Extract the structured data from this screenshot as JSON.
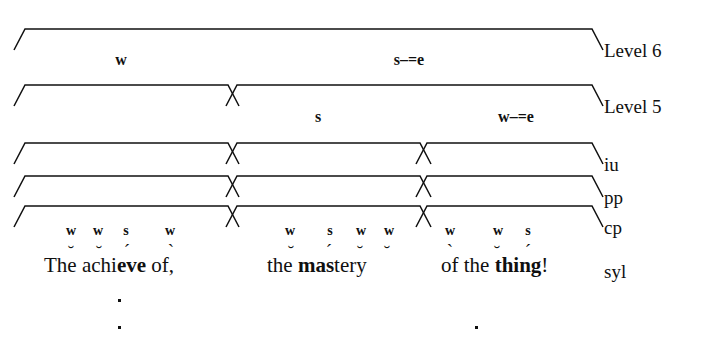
{
  "figure": {
    "text_line": "The achieve of, the mastery of the thing!"
  },
  "row_labels": [
    {
      "id": "level6",
      "label": "Level 6",
      "x": 604,
      "y": 41
    },
    {
      "id": "level5",
      "label": "Level 5",
      "x": 604,
      "y": 97
    },
    {
      "id": "iu",
      "label": "iu",
      "x": 604,
      "y": 155
    },
    {
      "id": "pp",
      "label": "pp",
      "x": 604,
      "y": 188
    },
    {
      "id": "cp",
      "label": "cp",
      "x": 604,
      "y": 218
    },
    {
      "id": "syl",
      "label": "syl",
      "x": 604,
      "y": 262
    }
  ],
  "brackets": {
    "stroke": "#101010",
    "rows": [
      {
        "id": "level6-row",
        "y_top": 29,
        "y_foot": 50,
        "spans": [
          {
            "x1": 25,
            "x2": 592
          }
        ]
      },
      {
        "id": "level5-row",
        "y_top": 85,
        "y_foot": 106,
        "spans": [
          {
            "x1": 25,
            "x2": 228
          },
          {
            "x1": 237,
            "x2": 592
          }
        ]
      },
      {
        "id": "iu-row",
        "y_top": 143,
        "y_foot": 164,
        "spans": [
          {
            "x1": 25,
            "x2": 228
          },
          {
            "x1": 237,
            "x2": 420
          },
          {
            "x1": 427,
            "x2": 592
          }
        ]
      },
      {
        "id": "pp-row",
        "y_top": 176,
        "y_foot": 197,
        "spans": [
          {
            "x1": 25,
            "x2": 228
          },
          {
            "x1": 237,
            "x2": 420
          },
          {
            "x1": 427,
            "x2": 592
          }
        ]
      },
      {
        "id": "cp-row",
        "y_top": 206,
        "y_foot": 227,
        "spans": [
          {
            "x1": 25,
            "x2": 228
          },
          {
            "x1": 237,
            "x2": 420
          },
          {
            "x1": 427,
            "x2": 592
          }
        ]
      }
    ]
  },
  "node_labels": [
    {
      "id": "l6-w",
      "label": "w",
      "x": 121,
      "y": 52,
      "size": "big"
    },
    {
      "id": "l6-se",
      "label": "s–=e",
      "x": 409,
      "y": 52,
      "size": "big"
    },
    {
      "id": "l5-s",
      "label": "s",
      "x": 318,
      "y": 109,
      "size": "big"
    },
    {
      "id": "l5-we",
      "label": "w–=e",
      "x": 516,
      "y": 109,
      "size": "big"
    }
  ],
  "terminals": [
    {
      "id": "g1-t1",
      "label": "w",
      "x": 71,
      "y": 224
    },
    {
      "id": "g1-t2",
      "label": "w",
      "x": 98,
      "y": 224
    },
    {
      "id": "g1-t3",
      "label": "s",
      "x": 126,
      "y": 224
    },
    {
      "id": "g1-t4",
      "label": "w",
      "x": 170,
      "y": 224
    },
    {
      "id": "g2-t1",
      "label": "w",
      "x": 290,
      "y": 224
    },
    {
      "id": "g2-t2",
      "label": "s",
      "x": 330,
      "y": 224
    },
    {
      "id": "g2-t3",
      "label": "w",
      "x": 361,
      "y": 224
    },
    {
      "id": "g2-t4",
      "label": "w",
      "x": 389,
      "y": 224
    },
    {
      "id": "g3-t1",
      "label": "w",
      "x": 450,
      "y": 224
    },
    {
      "id": "g3-t2",
      "label": "w",
      "x": 498,
      "y": 224
    },
    {
      "id": "g3-t3",
      "label": "s",
      "x": 528,
      "y": 224
    }
  ],
  "scan_marks": [
    {
      "id": "m1",
      "mark": "˘",
      "x": 71,
      "y": 243
    },
    {
      "id": "m2",
      "mark": "˘",
      "x": 99,
      "y": 243
    },
    {
      "id": "m3",
      "mark": "´",
      "x": 127,
      "y": 241
    },
    {
      "id": "m4",
      "mark": "`",
      "x": 171,
      "y": 241
    },
    {
      "id": "m5",
      "mark": "˘",
      "x": 291,
      "y": 243
    },
    {
      "id": "m6",
      "mark": "´",
      "x": 329,
      "y": 241
    },
    {
      "id": "m7",
      "mark": "˘",
      "x": 360,
      "y": 243
    },
    {
      "id": "m8",
      "mark": "˘",
      "x": 387,
      "y": 243
    },
    {
      "id": "m9",
      "mark": "`",
      "x": 450,
      "y": 241
    },
    {
      "id": "m10",
      "mark": "˘",
      "x": 497,
      "y": 243
    },
    {
      "id": "m11",
      "mark": "´",
      "x": 528,
      "y": 241
    }
  ],
  "text_chunks": [
    {
      "id": "chunk-1",
      "x": 44,
      "y": 255,
      "plain_before": "The achi",
      "bold": "eve",
      "plain_after": " of,"
    },
    {
      "id": "chunk-2",
      "x": 267,
      "y": 255,
      "plain_before": "the ",
      "bold": "mas",
      "plain_after": "tery"
    },
    {
      "id": "chunk-3",
      "x": 441,
      "y": 255,
      "plain_before": "of the ",
      "bold": "thing",
      "plain_after": "!"
    }
  ],
  "dots": [
    {
      "id": "dot-1",
      "x": 118,
      "y": 299
    },
    {
      "id": "dot-2",
      "x": 118,
      "y": 326
    },
    {
      "id": "dot-3",
      "x": 475,
      "y": 326
    }
  ]
}
